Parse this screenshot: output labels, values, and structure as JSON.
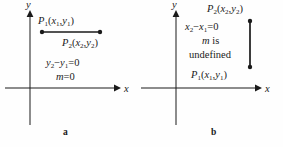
{
  "figure": {
    "background_color": "#fefefe",
    "ink_color": "#1a1a1a",
    "width": 283,
    "height": 147
  },
  "panels": [
    {
      "id": "a",
      "caption": "a",
      "axes": {
        "x_label": "x",
        "y_label": "y"
      },
      "segment": {
        "orientation": "horizontal",
        "endpoint_style": "filled-dot"
      },
      "labels": {
        "point1": {
          "name": "P",
          "sub": "1",
          "coords_open": "(",
          "cx": "x",
          "cx_sub": "1",
          "comma": ",",
          "cy": "y",
          "cy_sub": "1",
          "coords_close": ")"
        },
        "point2": {
          "name": "P",
          "sub": "2",
          "coords_open": "(",
          "cx": "x",
          "cx_sub": "2",
          "comma": ",",
          "cy": "y",
          "cy_sub": "2",
          "coords_close": ")"
        },
        "equation": {
          "lhs_var": "y",
          "lhs_sub": "2",
          "minus": "−",
          "rhs_var": "y",
          "rhs_sub": "1",
          "equals": "=",
          "value": "0"
        },
        "slope": {
          "symbol": "m",
          "equals": "=",
          "value": "0"
        }
      }
    },
    {
      "id": "b",
      "caption": "b",
      "axes": {
        "x_label": "x",
        "y_label": "y"
      },
      "segment": {
        "orientation": "vertical",
        "endpoint_style": "filled-dot"
      },
      "labels": {
        "point1": {
          "name": "P",
          "sub": "1",
          "coords_open": "(",
          "cx": "x",
          "cx_sub": "1",
          "comma": ",",
          "cy": "y",
          "cy_sub": "1",
          "coords_close": ")"
        },
        "point2": {
          "name": "P",
          "sub": "2",
          "coords_open": "(",
          "cx": "x",
          "cx_sub": "2",
          "comma": ",",
          "cy": "y",
          "cy_sub": "2",
          "coords_close": ")"
        },
        "equation": {
          "lhs_var": "x",
          "lhs_sub": "2",
          "minus": "−",
          "rhs_var": "x",
          "rhs_sub": "1",
          "equals": "=",
          "value": "0"
        },
        "slope": {
          "symbol": "m",
          "is_word": "is",
          "undefined_word": "undefined"
        }
      }
    }
  ]
}
